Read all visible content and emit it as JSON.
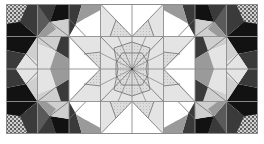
{
  "figure": {
    "grid": {
      "columns": 8,
      "rows": 4
    },
    "palette": {
      "white": "#ffffff",
      "very_light": "#e4e4e4",
      "light": "#cfcfcf",
      "stipple_light": "#d8d8d8",
      "mid": "#9a9a9a",
      "dark": "#5a5a5a",
      "darker": "#3a3a3a",
      "black": "#121212",
      "line": "#6e6e6e",
      "grid_line": "#8c8c8c"
    }
  }
}
